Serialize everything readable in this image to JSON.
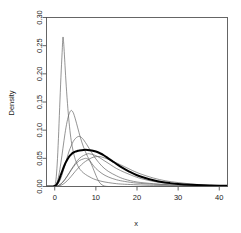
{
  "chart_data": {
    "type": "line",
    "title": "",
    "xlabel": "x",
    "ylabel": "Density",
    "xlim": [
      -2,
      42
    ],
    "ylim": [
      0.0,
      0.3
    ],
    "xticks": [
      0,
      10,
      20,
      30,
      40
    ],
    "xtick_labels": [
      "0",
      "10",
      "20",
      "30",
      "40"
    ],
    "yticks": [
      0.0,
      0.05,
      0.1,
      0.15,
      0.2,
      0.25,
      0.3
    ],
    "ytick_labels": [
      "0.00",
      "0.05",
      "0.10",
      "0.15",
      "0.20",
      "0.25",
      "0.30"
    ],
    "grid": false,
    "legend": null,
    "background": "#ffffff",
    "box_color": "#555555",
    "series": [
      {
        "name": "density-1",
        "style": "thin",
        "color": "#666666",
        "width": 0.7,
        "peak_x": 2.0,
        "peak_y": 0.265,
        "points": [
          [
            -2,
            0.0
          ],
          [
            -1,
            0.0
          ],
          [
            -0.5,
            0.0
          ],
          [
            0,
            0.002
          ],
          [
            0.3,
            0.012
          ],
          [
            0.6,
            0.04
          ],
          [
            0.9,
            0.085
          ],
          [
            1.2,
            0.14
          ],
          [
            1.5,
            0.193
          ],
          [
            1.8,
            0.238
          ],
          [
            2.0,
            0.265
          ],
          [
            2.2,
            0.252
          ],
          [
            2.5,
            0.215
          ],
          [
            2.8,
            0.178
          ],
          [
            3.2,
            0.138
          ],
          [
            3.6,
            0.106
          ],
          [
            4.0,
            0.082
          ],
          [
            4.5,
            0.062
          ],
          [
            5.0,
            0.048
          ],
          [
            5.6,
            0.037
          ],
          [
            6.2,
            0.03
          ],
          [
            7.0,
            0.024
          ],
          [
            8.0,
            0.019
          ],
          [
            9.0,
            0.015
          ],
          [
            10.0,
            0.012
          ],
          [
            11.5,
            0.009
          ],
          [
            13.0,
            0.007
          ],
          [
            15.0,
            0.005
          ],
          [
            17.0,
            0.004
          ],
          [
            20.0,
            0.003
          ],
          [
            24.0,
            0.002
          ],
          [
            28.0,
            0.0015
          ],
          [
            32.0,
            0.001
          ],
          [
            36.0,
            0.0008
          ],
          [
            40.0,
            0.0006
          ],
          [
            42.0,
            0.0005
          ]
        ]
      },
      {
        "name": "density-2",
        "style": "thin",
        "color": "#666666",
        "width": 0.7,
        "peak_x": 4.0,
        "peak_y": 0.135,
        "points": [
          [
            -2,
            0.0
          ],
          [
            -1,
            0.0
          ],
          [
            -0.3,
            0.0
          ],
          [
            0,
            0.001
          ],
          [
            0.5,
            0.006
          ],
          [
            1.0,
            0.02
          ],
          [
            1.5,
            0.042
          ],
          [
            2.0,
            0.068
          ],
          [
            2.5,
            0.094
          ],
          [
            3.0,
            0.115
          ],
          [
            3.5,
            0.129
          ],
          [
            4.0,
            0.135
          ],
          [
            4.5,
            0.131
          ],
          [
            5.0,
            0.12
          ],
          [
            5.6,
            0.104
          ],
          [
            6.2,
            0.088
          ],
          [
            7.0,
            0.07
          ],
          [
            8.0,
            0.053
          ],
          [
            9.0,
            0.041
          ],
          [
            10.0,
            0.032
          ],
          [
            11.5,
            0.023
          ],
          [
            13.0,
            0.017
          ],
          [
            15.0,
            0.012
          ],
          [
            17.0,
            0.009
          ],
          [
            20.0,
            0.006
          ],
          [
            24.0,
            0.004
          ],
          [
            28.0,
            0.003
          ],
          [
            32.0,
            0.002
          ],
          [
            36.0,
            0.0015
          ],
          [
            40.0,
            0.001
          ],
          [
            42.0,
            0.0009
          ]
        ]
      },
      {
        "name": "density-3",
        "style": "thin",
        "color": "#666666",
        "width": 0.7,
        "peak_x": 6.0,
        "peak_y": 0.089,
        "points": [
          [
            -2,
            0.0
          ],
          [
            -1,
            0.0
          ],
          [
            0,
            0.0
          ],
          [
            0.5,
            0.002
          ],
          [
            1.0,
            0.007
          ],
          [
            1.5,
            0.015
          ],
          [
            2.0,
            0.026
          ],
          [
            2.5,
            0.038
          ],
          [
            3.0,
            0.051
          ],
          [
            3.5,
            0.063
          ],
          [
            4.0,
            0.072
          ],
          [
            4.5,
            0.08
          ],
          [
            5.0,
            0.085
          ],
          [
            5.5,
            0.088
          ],
          [
            6.0,
            0.089
          ],
          [
            6.5,
            0.087
          ],
          [
            7.0,
            0.083
          ],
          [
            8.0,
            0.072
          ],
          [
            9.0,
            0.06
          ],
          [
            10.0,
            0.049
          ],
          [
            11.5,
            0.036
          ],
          [
            13.0,
            0.027
          ],
          [
            15.0,
            0.019
          ],
          [
            17.0,
            0.013
          ],
          [
            20.0,
            0.008
          ],
          [
            24.0,
            0.005
          ],
          [
            28.0,
            0.003
          ],
          [
            32.0,
            0.002
          ],
          [
            36.0,
            0.0015
          ],
          [
            40.0,
            0.001
          ],
          [
            42.0,
            0.0009
          ]
        ]
      },
      {
        "name": "density-4",
        "style": "thin",
        "color": "#666666",
        "width": 0.7,
        "peak_x": 8.5,
        "peak_y": 0.058,
        "points": [
          [
            -2,
            0.0
          ],
          [
            -1,
            0.0
          ],
          [
            0,
            0.0
          ],
          [
            1.0,
            0.002
          ],
          [
            2.0,
            0.008
          ],
          [
            3.0,
            0.018
          ],
          [
            4.0,
            0.03
          ],
          [
            5.0,
            0.041
          ],
          [
            6.0,
            0.05
          ],
          [
            7.0,
            0.055
          ],
          [
            8.0,
            0.058
          ],
          [
            8.5,
            0.058
          ],
          [
            9.5,
            0.056
          ],
          [
            10.5,
            0.053
          ],
          [
            12.0,
            0.046
          ],
          [
            13.5,
            0.039
          ],
          [
            15.0,
            0.032
          ],
          [
            17.0,
            0.025
          ],
          [
            19.0,
            0.019
          ],
          [
            21.0,
            0.014
          ],
          [
            24.0,
            0.009
          ],
          [
            27.0,
            0.006
          ],
          [
            30.0,
            0.004
          ],
          [
            34.0,
            0.0025
          ],
          [
            38.0,
            0.0015
          ],
          [
            40.0,
            0.001
          ],
          [
            42.0,
            0.0009
          ]
        ]
      },
      {
        "name": "density-5",
        "style": "thin",
        "color": "#666666",
        "width": 0.7,
        "peak_x": 10.5,
        "peak_y": 0.053,
        "points": [
          [
            -2,
            0.0
          ],
          [
            -1,
            0.0
          ],
          [
            0,
            0.0
          ],
          [
            1.0,
            0.001
          ],
          [
            2.0,
            0.004
          ],
          [
            3.0,
            0.01
          ],
          [
            4.0,
            0.018
          ],
          [
            5.0,
            0.027
          ],
          [
            6.0,
            0.035
          ],
          [
            7.0,
            0.042
          ],
          [
            8.0,
            0.047
          ],
          [
            9.0,
            0.051
          ],
          [
            10.0,
            0.053
          ],
          [
            11.0,
            0.053
          ],
          [
            12.0,
            0.051
          ],
          [
            13.5,
            0.047
          ],
          [
            15.0,
            0.042
          ],
          [
            17.0,
            0.035
          ],
          [
            19.0,
            0.028
          ],
          [
            21.0,
            0.022
          ],
          [
            24.0,
            0.015
          ],
          [
            27.0,
            0.01
          ],
          [
            30.0,
            0.007
          ],
          [
            34.0,
            0.004
          ],
          [
            38.0,
            0.002
          ],
          [
            40.0,
            0.0015
          ],
          [
            42.0,
            0.0012
          ]
        ]
      },
      {
        "name": "density-6-narrow",
        "style": "thin",
        "color": "#666666",
        "width": 0.7,
        "peak_x": 7.5,
        "peak_y": 0.05,
        "points": [
          [
            -2,
            0.0
          ],
          [
            -1,
            0.0
          ],
          [
            0,
            0.0
          ],
          [
            1.0,
            0.002
          ],
          [
            2.0,
            0.008
          ],
          [
            3.0,
            0.018
          ],
          [
            4.0,
            0.029
          ],
          [
            5.0,
            0.039
          ],
          [
            6.0,
            0.046
          ],
          [
            7.0,
            0.049
          ],
          [
            7.5,
            0.05
          ],
          [
            8.0,
            0.049
          ],
          [
            8.5,
            0.045
          ],
          [
            9.0,
            0.038
          ],
          [
            9.5,
            0.029
          ],
          [
            10.0,
            0.02
          ],
          [
            10.5,
            0.012
          ],
          [
            11.0,
            0.006
          ],
          [
            11.5,
            0.003
          ],
          [
            12.0,
            0.001
          ],
          [
            13.0,
            0.0
          ],
          [
            15.0,
            0.0
          ],
          [
            20.0,
            0.0
          ],
          [
            25.0,
            0.0
          ],
          [
            30.0,
            0.0
          ],
          [
            35.0,
            0.0
          ],
          [
            40.0,
            0.0
          ],
          [
            42.0,
            0.0
          ]
        ]
      },
      {
        "name": "density-pooled",
        "style": "thick",
        "color": "#000000",
        "width": 2.0,
        "peak_x": 8.0,
        "peak_y": 0.065,
        "points": [
          [
            -2,
            0.0
          ],
          [
            -1,
            0.0
          ],
          [
            -0.4,
            0.0
          ],
          [
            0,
            0.001
          ],
          [
            0.5,
            0.004
          ],
          [
            1.0,
            0.011
          ],
          [
            1.5,
            0.021
          ],
          [
            2.0,
            0.031
          ],
          [
            2.5,
            0.04
          ],
          [
            3.0,
            0.047
          ],
          [
            3.5,
            0.053
          ],
          [
            4.0,
            0.057
          ],
          [
            4.5,
            0.06
          ],
          [
            5.0,
            0.062
          ],
          [
            5.5,
            0.063
          ],
          [
            6.0,
            0.064
          ],
          [
            7.0,
            0.065
          ],
          [
            8.0,
            0.065
          ],
          [
            9.0,
            0.064
          ],
          [
            10.0,
            0.062
          ],
          [
            11.0,
            0.059
          ],
          [
            12.0,
            0.055
          ],
          [
            13.0,
            0.05
          ],
          [
            14.0,
            0.045
          ],
          [
            15.0,
            0.04
          ],
          [
            16.5,
            0.033
          ],
          [
            18.0,
            0.027
          ],
          [
            20.0,
            0.02
          ],
          [
            22.0,
            0.015
          ],
          [
            24.0,
            0.011
          ],
          [
            26.0,
            0.008
          ],
          [
            28.0,
            0.006
          ],
          [
            30.0,
            0.0045
          ],
          [
            33.0,
            0.003
          ],
          [
            36.0,
            0.002
          ],
          [
            38.0,
            0.0017
          ],
          [
            40.0,
            0.0015
          ],
          [
            42.0,
            0.0014
          ]
        ]
      }
    ]
  }
}
